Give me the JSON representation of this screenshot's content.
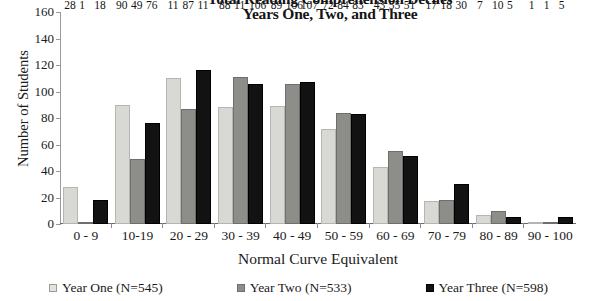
{
  "chart_data": {
    "type": "bar",
    "title": "Total Reading Comprehension Deciles",
    "subtitle": "Years One, Two, and Three",
    "xlabel": "Normal Curve Equivalent",
    "ylabel": "Number of Students",
    "ylim": [
      0,
      160
    ],
    "yticks": [
      0,
      20,
      40,
      60,
      80,
      100,
      120,
      140,
      160
    ],
    "grid": false,
    "legend_position": "bottom",
    "categories": [
      "0 - 9",
      "10-19",
      "20 - 29",
      "30 - 39",
      "40 - 49",
      "50 - 59",
      "60 - 69",
      "70 - 79",
      "80 - 89",
      "90 - 100"
    ],
    "series": [
      {
        "name": "Year One (N=545)",
        "color": "#d8d8d4",
        "values": [
          28,
          90,
          110,
          88,
          89,
          72,
          43,
          17,
          7,
          1
        ]
      },
      {
        "name": "Year Two (N=533)",
        "color": "#8d8d8a",
        "values": [
          1,
          49,
          87,
          111,
          106,
          84,
          55,
          18,
          10,
          1
        ]
      },
      {
        "name": "Year Three (N=598)",
        "color": "#121212",
        "values": [
          18,
          76,
          116,
          106,
          107,
          83,
          51,
          30,
          5,
          5
        ]
      }
    ],
    "value_labels": [
      [
        "28",
        "1",
        "18"
      ],
      [
        "90",
        "49",
        "76"
      ],
      [
        "11",
        "87",
        "11"
      ],
      [
        "88",
        "11",
        "106"
      ],
      [
        "89",
        "106",
        "107"
      ],
      [
        "72",
        "84",
        "83"
      ],
      [
        "43",
        "55",
        "51"
      ],
      [
        "17",
        "18",
        "30"
      ],
      [
        "7",
        "10",
        "5"
      ],
      [
        "1",
        "1",
        "5"
      ]
    ]
  }
}
